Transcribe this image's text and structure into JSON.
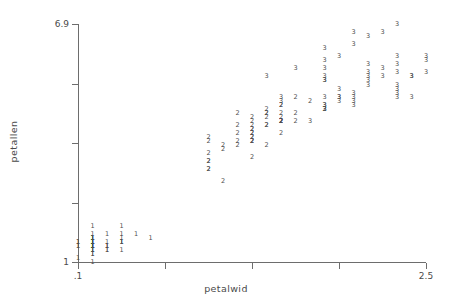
{
  "chart_data": {
    "type": "scatter",
    "title": "",
    "xlabel": "petalwid",
    "ylabel": "petallen",
    "xlim": [
      0.1,
      2.5
    ],
    "ylim": [
      1.0,
      6.9
    ],
    "grid": false,
    "legend": "none",
    "marker_style": "group-number-glyph",
    "group_labels": [
      "1",
      "2",
      "3"
    ],
    "xticks": [
      {
        "value": 0.1,
        "label": ".1"
      },
      {
        "value": 0.7,
        "label": ""
      },
      {
        "value": 1.3,
        "label": ""
      },
      {
        "value": 1.9,
        "label": ""
      },
      {
        "value": 2.5,
        "label": "2.5"
      }
    ],
    "yticks": [
      {
        "value": 1.0,
        "label": "1"
      },
      {
        "value": 2.475,
        "label": ""
      },
      {
        "value": 3.95,
        "label": ""
      },
      {
        "value": 5.425,
        "label": ""
      },
      {
        "value": 6.9,
        "label": "6.9"
      }
    ],
    "points": [
      {
        "x": 0.2,
        "y": 1.4,
        "g": "1"
      },
      {
        "x": 0.2,
        "y": 1.4,
        "g": "1"
      },
      {
        "x": 0.2,
        "y": 1.3,
        "g": "1"
      },
      {
        "x": 0.2,
        "y": 1.5,
        "g": "1"
      },
      {
        "x": 0.2,
        "y": 1.4,
        "g": "1"
      },
      {
        "x": 0.4,
        "y": 1.7,
        "g": "1"
      },
      {
        "x": 0.3,
        "y": 1.4,
        "g": "1"
      },
      {
        "x": 0.2,
        "y": 1.5,
        "g": "1"
      },
      {
        "x": 0.2,
        "y": 1.4,
        "g": "1"
      },
      {
        "x": 0.1,
        "y": 1.5,
        "g": "1"
      },
      {
        "x": 0.2,
        "y": 1.5,
        "g": "1"
      },
      {
        "x": 0.2,
        "y": 1.6,
        "g": "1"
      },
      {
        "x": 0.1,
        "y": 1.4,
        "g": "1"
      },
      {
        "x": 0.1,
        "y": 1.1,
        "g": "1"
      },
      {
        "x": 0.2,
        "y": 1.2,
        "g": "1"
      },
      {
        "x": 0.4,
        "y": 1.5,
        "g": "1"
      },
      {
        "x": 0.4,
        "y": 1.3,
        "g": "1"
      },
      {
        "x": 0.3,
        "y": 1.4,
        "g": "1"
      },
      {
        "x": 0.3,
        "y": 1.7,
        "g": "1"
      },
      {
        "x": 0.3,
        "y": 1.5,
        "g": "1"
      },
      {
        "x": 0.2,
        "y": 1.7,
        "g": "1"
      },
      {
        "x": 0.4,
        "y": 1.5,
        "g": "1"
      },
      {
        "x": 0.2,
        "y": 1.0,
        "g": "1"
      },
      {
        "x": 0.5,
        "y": 1.7,
        "g": "1"
      },
      {
        "x": 0.2,
        "y": 1.9,
        "g": "1"
      },
      {
        "x": 0.2,
        "y": 1.6,
        "g": "1"
      },
      {
        "x": 0.4,
        "y": 1.6,
        "g": "1"
      },
      {
        "x": 0.2,
        "y": 1.5,
        "g": "1"
      },
      {
        "x": 0.2,
        "y": 1.4,
        "g": "1"
      },
      {
        "x": 0.2,
        "y": 1.6,
        "g": "1"
      },
      {
        "x": 0.2,
        "y": 1.6,
        "g": "1"
      },
      {
        "x": 0.4,
        "y": 1.5,
        "g": "1"
      },
      {
        "x": 0.1,
        "y": 1.5,
        "g": "1"
      },
      {
        "x": 0.2,
        "y": 1.4,
        "g": "1"
      },
      {
        "x": 0.2,
        "y": 1.5,
        "g": "1"
      },
      {
        "x": 0.2,
        "y": 1.2,
        "g": "1"
      },
      {
        "x": 0.2,
        "y": 1.3,
        "g": "1"
      },
      {
        "x": 0.1,
        "y": 1.4,
        "g": "1"
      },
      {
        "x": 0.2,
        "y": 1.3,
        "g": "1"
      },
      {
        "x": 0.2,
        "y": 1.5,
        "g": "1"
      },
      {
        "x": 0.3,
        "y": 1.3,
        "g": "1"
      },
      {
        "x": 0.3,
        "y": 1.3,
        "g": "1"
      },
      {
        "x": 0.2,
        "y": 1.3,
        "g": "1"
      },
      {
        "x": 0.6,
        "y": 1.6,
        "g": "1"
      },
      {
        "x": 0.4,
        "y": 1.9,
        "g": "1"
      },
      {
        "x": 0.3,
        "y": 1.4,
        "g": "1"
      },
      {
        "x": 0.2,
        "y": 1.6,
        "g": "1"
      },
      {
        "x": 0.2,
        "y": 1.4,
        "g": "1"
      },
      {
        "x": 0.2,
        "y": 1.5,
        "g": "1"
      },
      {
        "x": 0.2,
        "y": 1.4,
        "g": "1"
      },
      {
        "x": 1.4,
        "y": 4.7,
        "g": "2"
      },
      {
        "x": 1.5,
        "y": 4.5,
        "g": "2"
      },
      {
        "x": 1.5,
        "y": 4.9,
        "g": "2"
      },
      {
        "x": 1.3,
        "y": 4.0,
        "g": "2"
      },
      {
        "x": 1.5,
        "y": 4.6,
        "g": "2"
      },
      {
        "x": 1.3,
        "y": 4.5,
        "g": "2"
      },
      {
        "x": 1.6,
        "y": 4.7,
        "g": "2"
      },
      {
        "x": 1.0,
        "y": 3.3,
        "g": "2"
      },
      {
        "x": 1.3,
        "y": 4.6,
        "g": "2"
      },
      {
        "x": 1.4,
        "y": 3.9,
        "g": "2"
      },
      {
        "x": 1.0,
        "y": 3.5,
        "g": "2"
      },
      {
        "x": 1.5,
        "y": 4.2,
        "g": "2"
      },
      {
        "x": 1.0,
        "y": 4.0,
        "g": "2"
      },
      {
        "x": 1.4,
        "y": 4.7,
        "g": "2"
      },
      {
        "x": 1.3,
        "y": 3.6,
        "g": "2"
      },
      {
        "x": 1.4,
        "y": 4.4,
        "g": "2"
      },
      {
        "x": 1.5,
        "y": 4.5,
        "g": "2"
      },
      {
        "x": 1.0,
        "y": 4.1,
        "g": "2"
      },
      {
        "x": 1.5,
        "y": 4.5,
        "g": "2"
      },
      {
        "x": 1.1,
        "y": 3.9,
        "g": "2"
      },
      {
        "x": 1.8,
        "y": 4.8,
        "g": "2"
      },
      {
        "x": 1.3,
        "y": 4.0,
        "g": "2"
      },
      {
        "x": 1.5,
        "y": 4.9,
        "g": "2"
      },
      {
        "x": 1.2,
        "y": 4.7,
        "g": "2"
      },
      {
        "x": 1.3,
        "y": 4.3,
        "g": "2"
      },
      {
        "x": 1.4,
        "y": 4.4,
        "g": "2"
      },
      {
        "x": 1.4,
        "y": 4.8,
        "g": "2"
      },
      {
        "x": 1.7,
        "y": 5.0,
        "g": "2"
      },
      {
        "x": 1.5,
        "y": 4.5,
        "g": "2"
      },
      {
        "x": 1.0,
        "y": 3.5,
        "g": "2"
      },
      {
        "x": 1.1,
        "y": 3.8,
        "g": "2"
      },
      {
        "x": 1.0,
        "y": 3.7,
        "g": "2"
      },
      {
        "x": 1.2,
        "y": 3.9,
        "g": "2"
      },
      {
        "x": 1.6,
        "y": 5.1,
        "g": "2"
      },
      {
        "x": 1.5,
        "y": 4.5,
        "g": "2"
      },
      {
        "x": 1.6,
        "y": 4.5,
        "g": "2"
      },
      {
        "x": 1.5,
        "y": 4.7,
        "g": "2"
      },
      {
        "x": 1.3,
        "y": 4.4,
        "g": "2"
      },
      {
        "x": 1.3,
        "y": 4.1,
        "g": "2"
      },
      {
        "x": 1.3,
        "y": 4.0,
        "g": "2"
      },
      {
        "x": 1.2,
        "y": 4.4,
        "g": "2"
      },
      {
        "x": 1.4,
        "y": 4.6,
        "g": "2"
      },
      {
        "x": 1.2,
        "y": 4.0,
        "g": "2"
      },
      {
        "x": 1.0,
        "y": 3.3,
        "g": "2"
      },
      {
        "x": 1.3,
        "y": 4.2,
        "g": "2"
      },
      {
        "x": 1.2,
        "y": 4.2,
        "g": "2"
      },
      {
        "x": 1.3,
        "y": 4.2,
        "g": "2"
      },
      {
        "x": 1.3,
        "y": 4.3,
        "g": "2"
      },
      {
        "x": 1.1,
        "y": 3.0,
        "g": "2"
      },
      {
        "x": 1.3,
        "y": 4.1,
        "g": "2"
      },
      {
        "x": 2.5,
        "y": 6.0,
        "g": "3"
      },
      {
        "x": 1.9,
        "y": 5.1,
        "g": "3"
      },
      {
        "x": 2.1,
        "y": 5.9,
        "g": "3"
      },
      {
        "x": 1.8,
        "y": 5.6,
        "g": "3"
      },
      {
        "x": 2.2,
        "y": 5.8,
        "g": "3"
      },
      {
        "x": 2.1,
        "y": 6.6,
        "g": "3"
      },
      {
        "x": 1.7,
        "y": 4.5,
        "g": "3"
      },
      {
        "x": 1.8,
        "y": 6.3,
        "g": "3"
      },
      {
        "x": 1.8,
        "y": 5.8,
        "g": "3"
      },
      {
        "x": 2.5,
        "y": 6.1,
        "g": "3"
      },
      {
        "x": 2.0,
        "y": 5.1,
        "g": "3"
      },
      {
        "x": 1.9,
        "y": 5.3,
        "g": "3"
      },
      {
        "x": 2.1,
        "y": 5.5,
        "g": "3"
      },
      {
        "x": 2.0,
        "y": 5.0,
        "g": "3"
      },
      {
        "x": 2.4,
        "y": 5.1,
        "g": "3"
      },
      {
        "x": 2.3,
        "y": 5.3,
        "g": "3"
      },
      {
        "x": 1.8,
        "y": 5.5,
        "g": "3"
      },
      {
        "x": 2.2,
        "y": 6.7,
        "g": "3"
      },
      {
        "x": 2.3,
        "y": 6.9,
        "g": "3"
      },
      {
        "x": 1.5,
        "y": 5.0,
        "g": "3"
      },
      {
        "x": 2.3,
        "y": 5.7,
        "g": "3"
      },
      {
        "x": 2.0,
        "y": 4.9,
        "g": "3"
      },
      {
        "x": 2.0,
        "y": 6.7,
        "g": "3"
      },
      {
        "x": 1.8,
        "y": 4.9,
        "g": "3"
      },
      {
        "x": 2.1,
        "y": 5.7,
        "g": "3"
      },
      {
        "x": 1.8,
        "y": 6.0,
        "g": "3"
      },
      {
        "x": 1.8,
        "y": 4.8,
        "g": "3"
      },
      {
        "x": 1.8,
        "y": 4.9,
        "g": "3"
      },
      {
        "x": 2.1,
        "y": 5.6,
        "g": "3"
      },
      {
        "x": 1.6,
        "y": 5.8,
        "g": "3"
      },
      {
        "x": 1.9,
        "y": 6.1,
        "g": "3"
      },
      {
        "x": 2.0,
        "y": 6.4,
        "g": "3"
      },
      {
        "x": 2.2,
        "y": 5.6,
        "g": "3"
      },
      {
        "x": 1.5,
        "y": 5.1,
        "g": "3"
      },
      {
        "x": 1.4,
        "y": 5.6,
        "g": "3"
      },
      {
        "x": 2.3,
        "y": 6.1,
        "g": "3"
      },
      {
        "x": 2.4,
        "y": 5.6,
        "g": "3"
      },
      {
        "x": 1.8,
        "y": 5.5,
        "g": "3"
      },
      {
        "x": 1.8,
        "y": 4.8,
        "g": "3"
      },
      {
        "x": 2.1,
        "y": 5.4,
        "g": "3"
      },
      {
        "x": 2.4,
        "y": 5.6,
        "g": "3"
      },
      {
        "x": 2.3,
        "y": 5.1,
        "g": "3"
      },
      {
        "x": 1.9,
        "y": 5.1,
        "g": "3"
      },
      {
        "x": 2.3,
        "y": 5.9,
        "g": "3"
      },
      {
        "x": 2.5,
        "y": 5.7,
        "g": "3"
      },
      {
        "x": 2.3,
        "y": 5.2,
        "g": "3"
      },
      {
        "x": 1.9,
        "y": 5.0,
        "g": "3"
      },
      {
        "x": 2.0,
        "y": 5.2,
        "g": "3"
      },
      {
        "x": 2.3,
        "y": 5.4,
        "g": "3"
      },
      {
        "x": 1.8,
        "y": 5.1,
        "g": "3"
      }
    ]
  }
}
